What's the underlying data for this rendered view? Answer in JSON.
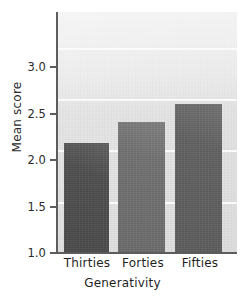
{
  "chart_data": {
    "type": "bar",
    "title": "",
    "subtitle": "",
    "xlabel": "Generativity",
    "ylabel": "Mean score",
    "categories": [
      "Thirties",
      "Forties",
      "Fifties"
    ],
    "values": [
      2.07,
      2.28,
      2.45
    ],
    "series": [
      {
        "name": "Mean score",
        "values": [
          2.07,
          2.28,
          2.45
        ]
      }
    ],
    "ylim": [
      1.0,
      3.35
    ],
    "xlim": [
      0,
      3
    ],
    "yticks": [
      "1.0",
      "1.5",
      "2.0",
      "2.5",
      "3.0"
    ],
    "ytick_values": [
      1.0,
      1.5,
      2.0,
      2.5,
      3.0
    ],
    "grid": "horizontal",
    "gridline_color": "#fbfbfb",
    "legend": "none",
    "legend_position": "none",
    "plot_background": "#e3e3e3",
    "figure_background": "#ffffff",
    "axis_color": "#5d5d5d",
    "bar_colors": [
      "#4c4c4c",
      "#6f6f6f",
      "#5f5f5f"
    ],
    "annotations": []
  },
  "axes": {
    "y": {
      "title": "Mean score",
      "ticks": [
        {
          "label": "3.0",
          "value": 3.0
        },
        {
          "label": "2.5",
          "value": 2.5
        },
        {
          "label": "2.0",
          "value": 2.0
        },
        {
          "label": "1.5",
          "value": 1.5
        },
        {
          "label": "1.0",
          "value": 1.0
        }
      ]
    },
    "x": {
      "title": "Generativity",
      "ticks": [
        {
          "label": "Thirties"
        },
        {
          "label": "Forties"
        },
        {
          "label": "Fifties"
        }
      ]
    }
  },
  "bars": [
    {
      "label": "Thirties",
      "value": 2.07,
      "color": "#4c4c4c"
    },
    {
      "label": "Forties",
      "value": 2.28,
      "color": "#6f6f6f"
    },
    {
      "label": "Fifties",
      "value": 2.45,
      "color": "#5f5f5f"
    }
  ]
}
